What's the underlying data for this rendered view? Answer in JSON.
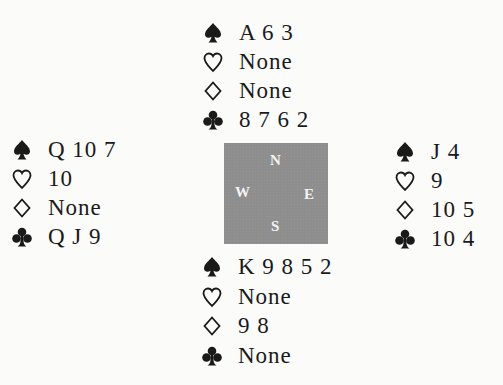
{
  "diagram": {
    "type": "bridge-hand-diagram",
    "colors": {
      "background": "#fbfbfa",
      "text": "#1a1a1a",
      "compass_box": "#8e8e8e",
      "compass_letters": "#f3f3f3"
    },
    "compass": {
      "north": "N",
      "west": "W",
      "east": "E",
      "south": "S"
    },
    "hands": {
      "north": {
        "spades": "A 6 3",
        "hearts": "None",
        "diamonds": "None",
        "clubs": "8 7 6 2"
      },
      "west": {
        "spades": "Q 10 7",
        "hearts": "10",
        "diamonds": "None",
        "clubs": "Q J 9"
      },
      "east": {
        "spades": "J 4",
        "hearts": "9",
        "diamonds": "10 5",
        "clubs": "10 4"
      },
      "south": {
        "spades": "K 9 8 5 2",
        "hearts": "None",
        "diamonds": "9 8",
        "clubs": "None"
      }
    },
    "suit_icons": {
      "spades": "spade-icon (filled)",
      "hearts": "heart-icon (outline)",
      "diamonds": "diamond-icon (outline)",
      "clubs": "club-icon (filled)"
    }
  }
}
